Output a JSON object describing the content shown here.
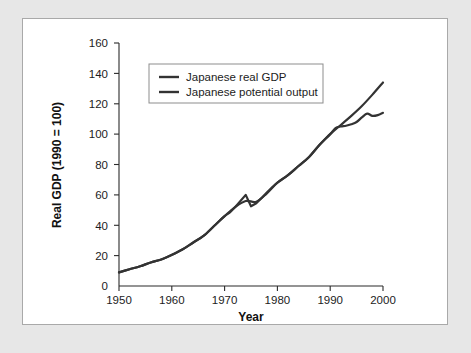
{
  "figure": {
    "panel_background": "#ffffff",
    "frame_background": "#e7e7e7",
    "border_color": "#a9a9a9"
  },
  "chart_data": {
    "type": "line",
    "title": "",
    "xlabel": "Year",
    "ylabel": "Real GDP (1990 = 100)",
    "xlim": [
      1950,
      2000
    ],
    "ylim": [
      0,
      160
    ],
    "xticks": [
      1950,
      1960,
      1970,
      1980,
      1990,
      2000
    ],
    "xtick_labels": [
      "1950",
      "1960",
      "1970",
      "1980",
      "1990",
      "2000"
    ],
    "yticks": [
      0,
      20,
      40,
      60,
      80,
      100,
      120,
      140,
      160
    ],
    "ytick_labels": [
      "0",
      "20",
      "40",
      "60",
      "80",
      "100",
      "120",
      "140",
      "160"
    ],
    "grid": false,
    "legend_position": "upper left",
    "line_color": "#333333",
    "series": [
      {
        "name": "Japanese real GDP",
        "x": [
          1950,
          1952,
          1954,
          1956,
          1958,
          1960,
          1962,
          1964,
          1966,
          1968,
          1970,
          1971,
          1972,
          1973,
          1974,
          1975,
          1976,
          1977,
          1978,
          1979,
          1980,
          1982,
          1984,
          1986,
          1988,
          1990,
          1991,
          1992,
          1993,
          1994,
          1995,
          1996,
          1997,
          1998,
          1999,
          2000
        ],
        "values": [
          9,
          11,
          13,
          15.5,
          17.5,
          20.5,
          24,
          28.5,
          33,
          39.5,
          46,
          48.5,
          52,
          56,
          60,
          52.5,
          54.5,
          58,
          61.5,
          65,
          68,
          73,
          79,
          85,
          93,
          100,
          104,
          105,
          105.5,
          106.5,
          108,
          111,
          113.5,
          112,
          112.5,
          114
        ],
        "note": "Flattens sharply after 1991 (the Lost Decade); sharp oil-shock spike and drop at 1974-75"
      },
      {
        "name": "Japanese potential output",
        "x": [
          1950,
          1952,
          1954,
          1956,
          1958,
          1960,
          1962,
          1964,
          1966,
          1968,
          1970,
          1972,
          1974,
          1976,
          1978,
          1980,
          1982,
          1984,
          1986,
          1988,
          1990,
          1992,
          1994,
          1996,
          1998,
          2000
        ],
        "values": [
          9,
          11,
          13,
          15.5,
          17.5,
          20.5,
          24,
          28.5,
          33,
          39.5,
          46,
          52,
          56,
          55.5,
          61,
          68,
          73,
          79,
          85,
          93,
          100,
          106,
          112,
          118.5,
          126,
          134
        ],
        "note": "Continues on trend growth path after 1991, diverging above actual real GDP"
      }
    ],
    "legend_entries": [
      "Japanese real GDP",
      "Japanese potential output"
    ]
  }
}
